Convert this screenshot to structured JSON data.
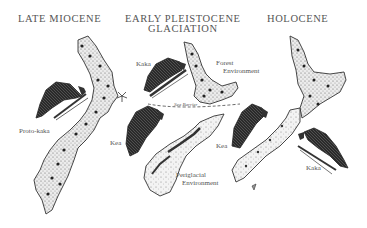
{
  "headings": {
    "late_miocene": "LATE MIOCENE",
    "early_pleistocene_line1": "EARLY PLEISTOCENE",
    "early_pleistocene_line2": "GLACIATION",
    "holocene": "HOLOCENE"
  },
  "labels": {
    "proto_kaka": "Proto-kaka",
    "kaka_mid": "Kaka",
    "forest_line1": "Forest",
    "forest_line2": "Environment",
    "sea_barrier": "Sea Barrier",
    "kea_mid": "Kea",
    "periglacial_line1": "Periglacial",
    "periglacial_line2": "Environment",
    "kea_right": "Kea",
    "kaka_right": "Kaka"
  },
  "colors": {
    "ink": "#333333",
    "land_fill": "#d9d9d9",
    "background": "#ffffff"
  }
}
